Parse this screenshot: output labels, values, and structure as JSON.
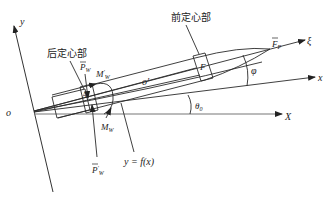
{
  "diagram": {
    "labels": {
      "y_axis": "y",
      "x_axis_upper": "x",
      "X_axis": "X",
      "xi_axis": "ξ",
      "origin": "o",
      "front_centering": "前定心部",
      "rear_centering": "后定心部",
      "Fp_base": "F",
      "Fp_sub": "P",
      "F_center": "F",
      "Pw_base": "P",
      "Pw_sub": "W",
      "Mw_prime_base": "M",
      "Mw_prime_sup": "′",
      "Mw_prime_sub": "W",
      "Mw_base": "M",
      "Mw_sub": "W",
      "Pw_prime_base": "P",
      "Pw_prime_sup": "′",
      "Pw_prime_sub": "W",
      "o_prime": "o′",
      "curve_eq": "y = f(x)",
      "phi": "φ",
      "theta_base": "θ",
      "theta_sub": "0",
      "A_point": "A"
    }
  }
}
